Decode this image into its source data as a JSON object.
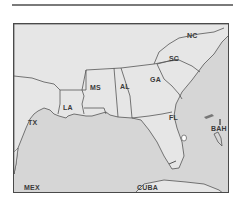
{
  "map": {
    "region": "Southeastern United States and Gulf of Mexico",
    "colors": {
      "land": "#e6e6e6",
      "water": "#d6d6d6",
      "border": "#555555",
      "frame": "#4a4a4a"
    },
    "states": [
      {
        "abbr": "NC"
      },
      {
        "abbr": "SC"
      },
      {
        "abbr": "GA"
      },
      {
        "abbr": "AL"
      },
      {
        "abbr": "MS"
      },
      {
        "abbr": "LA"
      },
      {
        "abbr": "TX"
      },
      {
        "abbr": "FL"
      }
    ],
    "countries": [
      {
        "abbr": "BAH"
      },
      {
        "abbr": "MEX"
      },
      {
        "abbr": "CUBA"
      }
    ]
  }
}
